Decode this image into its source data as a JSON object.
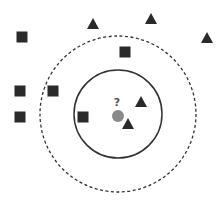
{
  "diagram": {
    "title": "",
    "query_point": {
      "label": "?",
      "x": 118,
      "y": 116,
      "r": 6,
      "color": "#8a8a8a"
    },
    "inner_circle": {
      "cx": 118,
      "cy": 114,
      "r": 44,
      "style": "solid",
      "color": "#333333"
    },
    "outer_circle": {
      "cx": 118,
      "cy": 114,
      "r": 78,
      "style": "dashed",
      "color": "#333333"
    },
    "squares": [
      {
        "x": 22,
        "y": 37
      },
      {
        "x": 125,
        "y": 52
      },
      {
        "x": 20,
        "y": 91
      },
      {
        "x": 53,
        "y": 91
      },
      {
        "x": 20,
        "y": 117
      },
      {
        "x": 83,
        "y": 117
      }
    ],
    "triangles": [
      {
        "x": 93,
        "y": 24
      },
      {
        "x": 151,
        "y": 19
      },
      {
        "x": 207,
        "y": 38
      },
      {
        "x": 141,
        "y": 102
      },
      {
        "x": 128,
        "y": 124
      }
    ],
    "marker_color": "#2a2a2a"
  }
}
